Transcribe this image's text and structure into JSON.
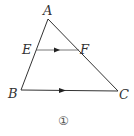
{
  "figure": {
    "caption": "①",
    "vertices": {
      "A": {
        "label": "A",
        "x": 48,
        "y": 19
      },
      "B": {
        "label": "B",
        "x": 21,
        "y": 90
      },
      "C": {
        "label": "C",
        "x": 118,
        "y": 91
      }
    },
    "points": {
      "E": {
        "label": "E",
        "x": 36,
        "y": 50
      },
      "F": {
        "label": "F",
        "x": 79,
        "y": 50
      }
    },
    "segments": [
      "AB",
      "AC",
      "BC",
      "EF"
    ],
    "parallel_marks": [
      "EF",
      "BC"
    ],
    "colors": {
      "line": "#333333",
      "arrow": "#222222",
      "text": "#333333"
    }
  }
}
